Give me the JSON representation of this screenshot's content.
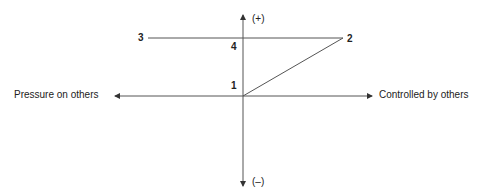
{
  "diagram": {
    "axes": {
      "left_label": "Pressure on others",
      "right_label": "Controlled by others",
      "top_label": "(+)",
      "bottom_label": "(–)"
    },
    "points": [
      {
        "id": "1",
        "label": "1"
      },
      {
        "id": "2",
        "label": "2"
      },
      {
        "id": "3",
        "label": "3"
      },
      {
        "id": "4",
        "label": "4"
      }
    ],
    "colors": {
      "line": "#555555",
      "text": "#222222"
    }
  }
}
